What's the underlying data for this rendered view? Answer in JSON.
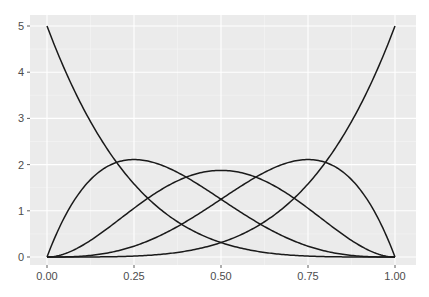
{
  "chart_data": {
    "type": "line",
    "title": "",
    "xlabel": "",
    "ylabel": "",
    "xlim": [
      0,
      1
    ],
    "ylim": [
      0,
      5
    ],
    "x_ticks": [
      "0.00",
      "0.25",
      "0.50",
      "0.75",
      "1.00"
    ],
    "y_ticks": [
      "0",
      "1",
      "2",
      "3",
      "4",
      "5"
    ],
    "grid": true,
    "legend": "none",
    "series": [
      {
        "name": "B0",
        "formula": "5*(1-x)^4",
        "x": [
          0,
          0.25,
          0.5,
          0.75,
          1
        ],
        "values": [
          5.0,
          1.582,
          0.3125,
          0.0195,
          0.0
        ]
      },
      {
        "name": "B1",
        "formula": "20*x*(1-x)^3",
        "x": [
          0,
          0.25,
          0.5,
          0.75,
          1
        ],
        "values": [
          0.0,
          2.109,
          1.25,
          0.234,
          0.0
        ]
      },
      {
        "name": "B2",
        "formula": "30*x^2*(1-x)^2",
        "x": [
          0,
          0.25,
          0.5,
          0.75,
          1
        ],
        "values": [
          0.0,
          1.055,
          1.875,
          1.055,
          0.0
        ]
      },
      {
        "name": "B3",
        "formula": "20*x^3*(1-x)",
        "x": [
          0,
          0.25,
          0.5,
          0.75,
          1
        ],
        "values": [
          0.0,
          0.234,
          1.25,
          2.109,
          0.0
        ]
      },
      {
        "name": "B4",
        "formula": "5*x^4",
        "x": [
          0,
          0.25,
          0.5,
          0.75,
          1
        ],
        "values": [
          0.0,
          0.0195,
          0.3125,
          1.582,
          5.0
        ]
      }
    ],
    "colors": {
      "panel": "#ebebeb",
      "grid_major": "#ffffff",
      "line": "#1a1a1a",
      "text": "#4d4d4d"
    }
  }
}
